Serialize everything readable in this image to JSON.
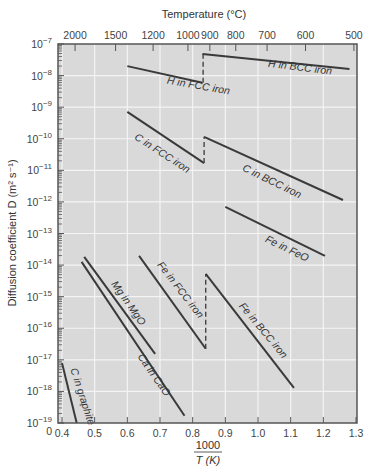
{
  "chart_data": {
    "type": "line",
    "title": "",
    "xlabel_numerator": "1000",
    "xlabel_denominator": "T (K)",
    "ylabel": "Diffusion coefficient D (m² s⁻¹)",
    "top_axis_label": "Temperature (°C)",
    "xlim": [
      0.4,
      1.3
    ],
    "ylim_log10": [
      -19,
      -7
    ],
    "grid": true,
    "x_ticks": [
      "0.4",
      "0.5",
      "0.6",
      "0.7",
      "0.8",
      "0.9",
      "1.0",
      "1.1",
      "1.2",
      "1.3"
    ],
    "y_ticks_log10": [
      -7,
      -8,
      -9,
      -10,
      -11,
      -12,
      -13,
      -14,
      -15,
      -16,
      -17,
      -18,
      -19
    ],
    "top_ticks_celsius": [
      2000,
      1500,
      1200,
      1000,
      900,
      800,
      700,
      600,
      500
    ],
    "series": [
      {
        "name": "H in FCC iron",
        "x": [
          0.6,
          0.83
        ],
        "log10_D": [
          -7.7,
          -8.23
        ],
        "label_pos": [
          0.72,
          -8.25
        ],
        "label_angle": 10
      },
      {
        "name": "H in BCC iron",
        "x": [
          0.83,
          1.28
        ],
        "log10_D": [
          -7.32,
          -7.79
        ],
        "label_pos": [
          1.03,
          -7.72
        ],
        "label_angle": 7
      },
      {
        "name": "C in FCC iron",
        "x": [
          0.6,
          0.835
        ],
        "log10_D": [
          -9.15,
          -10.77
        ],
        "label_pos": [
          0.62,
          -10.0
        ],
        "label_angle": 33
      },
      {
        "name": "C in BCC iron",
        "x": [
          0.835,
          1.26
        ],
        "log10_D": [
          -9.94,
          -11.94
        ],
        "label_pos": [
          0.95,
          -11.0
        ],
        "label_angle": 26
      },
      {
        "name": "Fe in FeO",
        "x": [
          0.9,
          1.205
        ],
        "log10_D": [
          -12.16,
          -13.71
        ],
        "label_pos": [
          1.02,
          -13.25
        ],
        "label_angle": 26
      },
      {
        "name": "Fe in FCC iron",
        "x": [
          0.636,
          0.84
        ],
        "log10_D": [
          -13.71,
          -16.65
        ],
        "label_pos": [
          0.69,
          -14.0
        ],
        "label_angle": 52
      },
      {
        "name": "Fe in BCC iron",
        "x": [
          0.84,
          1.11
        ],
        "log10_D": [
          -14.28,
          -17.89
        ],
        "label_pos": [
          0.94,
          -15.3
        ],
        "label_angle": 50
      },
      {
        "name": "Mg in MgO",
        "x": [
          0.468,
          0.685
        ],
        "log10_D": [
          -13.74,
          -16.81
        ],
        "label_pos": [
          0.55,
          -14.6
        ],
        "label_angle": 55
      },
      {
        "name": "Ca in CaO",
        "x": [
          0.46,
          0.775
        ],
        "log10_D": [
          -13.9,
          -18.77
        ],
        "label_pos": [
          0.63,
          -16.9
        ],
        "label_angle": 55
      },
      {
        "name": "C in graphite",
        "x": [
          0.4,
          0.445
        ],
        "log10_D": [
          -17.1,
          -19.0
        ],
        "label_pos": [
          0.425,
          -17.3
        ],
        "label_angle": 72
      }
    ],
    "phase_transitions": [
      {
        "x": 0.832,
        "from": -8.23,
        "to": -7.32,
        "style": "dashed"
      },
      {
        "x": 0.835,
        "from": -10.77,
        "to": -9.94,
        "style": "dashed"
      },
      {
        "x": 0.84,
        "from": -16.65,
        "to": -14.28,
        "style": "dashed"
      }
    ]
  },
  "colors": {
    "plot_background": "#d9d9d9",
    "grid": "#f4f4f4",
    "line": "#3a3a3a",
    "frame": "#555555"
  }
}
